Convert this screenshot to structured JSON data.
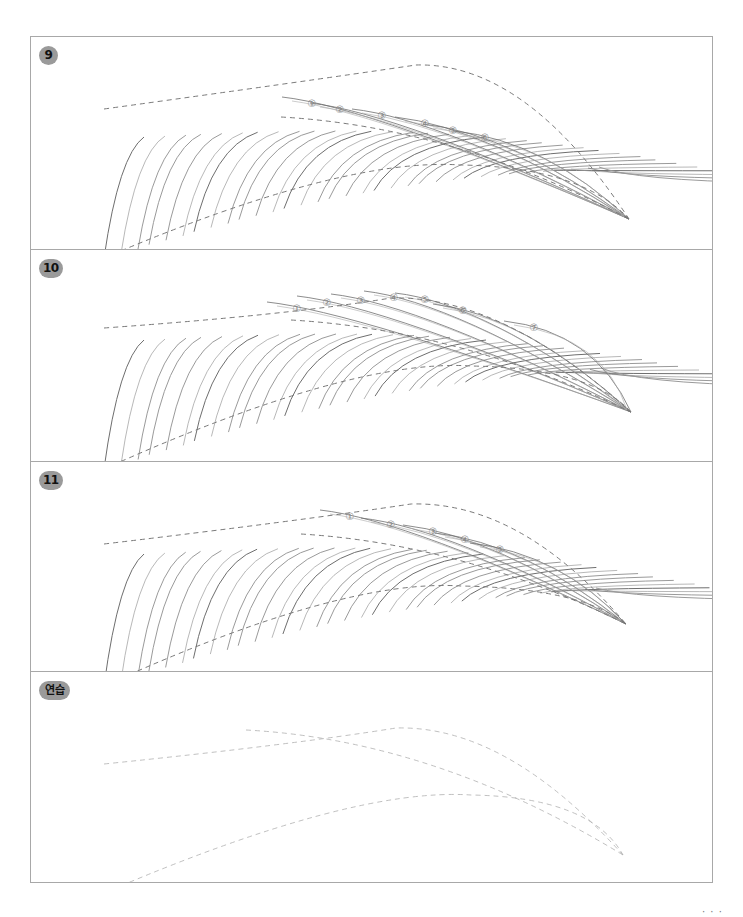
{
  "worksheet": {
    "type": "eyebrow stroke drawing practice",
    "border_color": "#a8a8a8",
    "stroke_color": "#6e6e6e",
    "guide_color": "#7a7a7a",
    "badge_color": "#9a9a9a"
  },
  "panels": [
    {
      "id": "step-9",
      "badge": "9",
      "top": 0,
      "height": 212,
      "guide": {
        "start_top": [
          73,
          42
        ],
        "peak_top": [
          385,
          -10
        ],
        "tail": [
          598,
          152
        ],
        "inner_edge_start": [
          250,
          50
        ],
        "bottom_start": [
          73,
          191
        ],
        "bottom_mid": [
          430,
          100
        ]
      },
      "markers": [
        "①",
        "②",
        "③",
        "④",
        "⑤",
        "⑥"
      ],
      "marker_positions": [
        [
          281,
          50
        ],
        [
          309,
          56
        ],
        [
          351,
          62
        ],
        [
          394,
          70
        ],
        [
          422,
          77
        ],
        [
          454,
          84
        ]
      ],
      "stroke_count": 34,
      "upper_strokes": 6
    },
    {
      "id": "step-10",
      "badge": "10",
      "top": 212,
      "height": 212,
      "guide": {
        "start_top": [
          73,
          48
        ],
        "peak_top": [
          360,
          10
        ],
        "tail": [
          600,
          132
        ],
        "inner_edge_start": [
          260,
          40
        ],
        "bottom_start": [
          73,
          189
        ],
        "bottom_mid": [
          440,
          88
        ]
      },
      "markers": [
        "①",
        "②",
        "③",
        "④",
        "⑤",
        "⑥",
        "⑦"
      ],
      "marker_positions": [
        [
          266,
          42
        ],
        [
          296,
          36
        ],
        [
          330,
          34
        ],
        [
          363,
          31
        ],
        [
          394,
          33
        ],
        [
          432,
          44
        ],
        [
          503,
          61
        ]
      ],
      "stroke_count": 34,
      "upper_strokes": 7
    },
    {
      "id": "step-11",
      "badge": "11",
      "top": 424,
      "height": 210,
      "guide": {
        "start_top": [
          73,
          52
        ],
        "peak_top": [
          380,
          4
        ],
        "tail": [
          595,
          132
        ],
        "inner_edge_start": [
          270,
          42
        ],
        "bottom_start": [
          73,
          194
        ],
        "bottom_mid": [
          430,
          96
        ]
      },
      "markers": [
        "①",
        "②",
        "③",
        "④",
        "⑤"
      ],
      "marker_positions": [
        [
          319,
          38
        ],
        [
          360,
          46
        ],
        [
          402,
          53
        ],
        [
          434,
          61
        ],
        [
          469,
          71
        ]
      ],
      "stroke_count": 34,
      "upper_strokes": 5
    },
    {
      "id": "practice",
      "badge": "연습",
      "top": 634,
      "height": 211,
      "guide": {
        "start_top": [
          73,
          62
        ],
        "peak_top": [
          365,
          18
        ],
        "tail": [
          592,
          153
        ],
        "inner_edge_start": [
          215,
          28
        ],
        "bottom_start": [
          73,
          191
        ],
        "bottom_mid": [
          440,
          95
        ]
      },
      "markers": [],
      "marker_positions": [],
      "stroke_count": 0,
      "upper_strokes": 0
    }
  ],
  "page_number_fragment": "· · ·"
}
